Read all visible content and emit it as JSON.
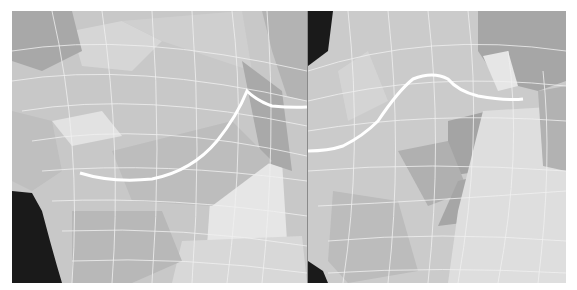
{
  "figure": {
    "panels": [
      {
        "id": "left",
        "label": "mesh-view-left",
        "edge_loop_color": "#ffffff",
        "background": "#c9c9c9"
      },
      {
        "id": "right",
        "label": "mesh-view-right",
        "edge_loop_color": "#ffffff",
        "background": "#c9c9c9"
      }
    ],
    "colors": {
      "mesh_light": "#e4e4e4",
      "mesh_mid": "#c4c4c4",
      "mesh_dark": "#9c9c9c",
      "void": "#1a1a1a",
      "wire": "#f2f2f2"
    }
  }
}
